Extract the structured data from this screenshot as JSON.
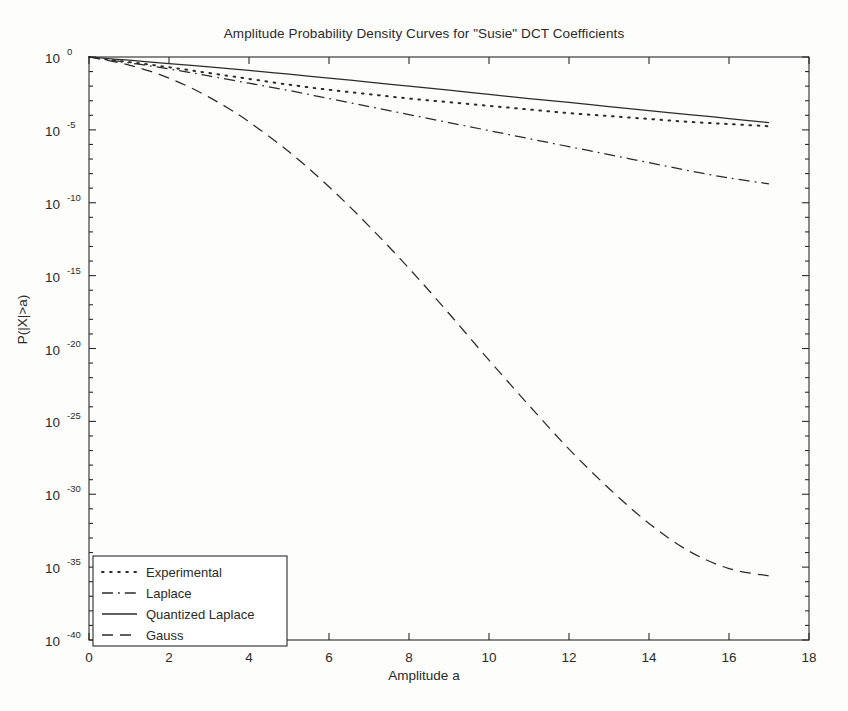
{
  "chart_data": {
    "type": "line",
    "title": "Amplitude Probability Density Curves for \"Susie\" DCT Coefficients",
    "xlabel": "Amplitude a",
    "ylabel": "P(|X|>a)",
    "xlim": [
      0,
      18
    ],
    "ylim_exponent": [
      -40,
      0
    ],
    "yscale": "log",
    "grid": false,
    "legend_position": "lower left",
    "xticks": [
      0,
      2,
      4,
      6,
      8,
      10,
      12,
      14,
      16,
      18
    ],
    "xticklabels": [
      "0",
      "2",
      "4",
      "6",
      "8",
      "10",
      "12",
      "14",
      "16",
      "18"
    ],
    "yticks_exponent": [
      0,
      -5,
      -10,
      -15,
      -20,
      -25,
      -30,
      -35,
      -40
    ],
    "yticklabels": [
      "10 0",
      "10 -5",
      "10 -10",
      "10 -15",
      "10 -20",
      "10 -25",
      "10 -30",
      "10 -35",
      "10 -40"
    ],
    "ytick_mantissa": "10",
    "ytick_exponents": [
      "0",
      "-5",
      "-10",
      "-15",
      "-20",
      "-25",
      "-30",
      "-35",
      "-40"
    ],
    "series": [
      {
        "name": "Experimental",
        "style": "dotted",
        "color": "#2b2b2b",
        "x": [
          0,
          0.5,
          1,
          1.5,
          2,
          2.5,
          3,
          3.5,
          4,
          5,
          6,
          7,
          8,
          9,
          10,
          11,
          12,
          13,
          14,
          15,
          16,
          17
        ],
        "y_exponent": [
          0,
          -0.18,
          -0.35,
          -0.52,
          -0.7,
          -0.9,
          -1.1,
          -1.3,
          -1.5,
          -1.9,
          -2.25,
          -2.55,
          -2.85,
          -3.1,
          -3.35,
          -3.6,
          -3.85,
          -4.05,
          -4.25,
          -4.45,
          -4.6,
          -4.75
        ]
      },
      {
        "name": "Laplace",
        "style": "dashdot",
        "color": "#2b2b2b",
        "x": [
          0,
          0.5,
          1,
          1.5,
          2,
          2.5,
          3,
          4,
          5,
          6,
          7,
          8,
          9,
          10,
          11,
          12,
          13,
          14,
          15,
          16,
          17
        ],
        "y_exponent": [
          0,
          -0.2,
          -0.4,
          -0.6,
          -0.82,
          -1.05,
          -1.3,
          -1.8,
          -2.3,
          -2.85,
          -3.4,
          -3.95,
          -4.5,
          -5.05,
          -5.6,
          -6.15,
          -6.7,
          -7.25,
          -7.8,
          -8.3,
          -8.7
        ]
      },
      {
        "name": "Quantized Laplace",
        "style": "solid",
        "color": "#2b2b2b",
        "x": [
          0,
          1,
          2,
          3,
          4,
          5,
          6,
          7,
          8,
          9,
          10,
          11,
          12,
          13,
          14,
          15,
          16,
          17
        ],
        "y_exponent": [
          0,
          -0.22,
          -0.45,
          -0.68,
          -0.92,
          -1.18,
          -1.45,
          -1.72,
          -2.0,
          -2.28,
          -2.56,
          -2.85,
          -3.12,
          -3.4,
          -3.68,
          -3.95,
          -4.22,
          -4.5
        ]
      },
      {
        "name": "Gauss",
        "style": "dashed",
        "color": "#2b2b2b",
        "x": [
          0,
          0.5,
          1,
          1.5,
          2,
          2.5,
          3,
          3.5,
          4,
          5,
          6,
          7,
          8,
          9,
          10,
          11,
          12,
          13,
          14,
          15,
          16,
          17
        ],
        "y_exponent": [
          0,
          -0.25,
          -0.55,
          -0.95,
          -1.45,
          -2.05,
          -2.75,
          -3.55,
          -4.45,
          -6.5,
          -8.9,
          -11.6,
          -14.5,
          -17.6,
          -20.8,
          -23.9,
          -26.9,
          -29.6,
          -32.0,
          -33.9,
          -35.1,
          -35.6
        ]
      }
    ]
  },
  "legend": {
    "entries": [
      {
        "label": "Experimental",
        "style": "dotted"
      },
      {
        "label": "Laplace",
        "style": "dashdot"
      },
      {
        "label": "Quantized Laplace",
        "style": "solid"
      },
      {
        "label": "Gauss",
        "style": "dashed"
      }
    ]
  }
}
